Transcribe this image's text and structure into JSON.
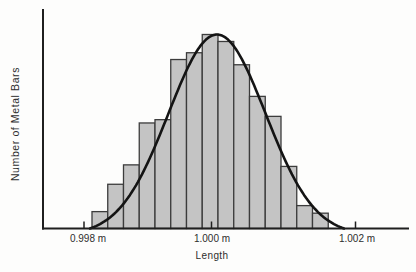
{
  "figure": {
    "background": "#fdfdfc",
    "ink_color": "#1f1f1f",
    "bar_fill": "#c4c4c4",
    "bar_stroke": "#3c3c3c",
    "curve_color": "#141414",
    "text_color": "#2e2e2e"
  },
  "chart_data": {
    "type": "bar",
    "subtype": "histogram_with_normal_curve",
    "title": "",
    "xlabel": "Length",
    "ylabel": "Number of Metal Bars",
    "x_tick_labels": [
      "0.998 m",
      "1.000 m",
      "1.002 m"
    ],
    "x_tick_values_m": [
      0.998,
      1.0,
      1.002
    ],
    "y_axis_tick_labels": "none (frequency axis unlabeled)",
    "grid": "off",
    "legend": "none",
    "bin_width_m_approx": 0.00023,
    "bars": {
      "count": 15,
      "centers_m_approx": [
        0.99835,
        0.99858,
        0.99881,
        0.99905,
        0.99928,
        0.99951,
        0.99974,
        0.99997,
        1.00021,
        1.00044,
        1.00067,
        1.0009,
        1.00114,
        1.00137,
        1.0016
      ],
      "relative_heights_pct_of_max": [
        8.7,
        22.8,
        32.8,
        54.4,
        56.1,
        87.1,
        90.6,
        100,
        96.4,
        84.4,
        68.1,
        57.8,
        32.0,
        11.8,
        7.9
      ]
    },
    "curve": {
      "shape": "normal",
      "mean_m_approx": 1.0001,
      "relative_peak_pct_of_max_bar": 100,
      "baseline_span_m_approx": [
        0.9983,
        1.0019
      ]
    }
  }
}
